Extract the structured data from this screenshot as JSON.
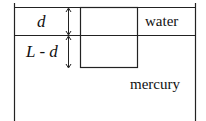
{
  "diagram": {
    "labels": {
      "d": "d",
      "l_minus_d": "L - d",
      "water": "water",
      "mercury": "mercury"
    },
    "regions": [
      {
        "name": "water",
        "description": "upper liquid layer"
      },
      {
        "name": "mercury",
        "description": "lower liquid layer"
      }
    ],
    "object": "block partly submerged, spanning water and mercury",
    "colors": {
      "line": "#222222",
      "background": "#ffffff"
    }
  }
}
